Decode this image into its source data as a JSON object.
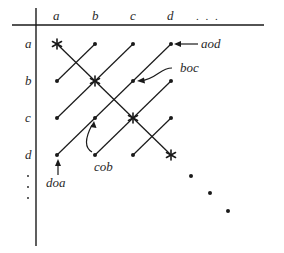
{
  "diagram": {
    "column_headers": [
      "a",
      "b",
      "c",
      "d",
      ". . ."
    ],
    "row_headers": [
      "a",
      "b",
      "c",
      "d"
    ],
    "row_ellipsis": "⋮",
    "annotations": {
      "aod": "aod",
      "boc": "boc",
      "cob": "cob",
      "doa": "doa"
    },
    "colors": {
      "ink": "#1a1a1a",
      "background": "#ffffff"
    },
    "grid": {
      "columns_x": [
        57,
        95,
        133,
        171
      ],
      "rows_y": [
        44,
        81,
        118,
        155
      ]
    },
    "diagonal_markers": [
      "star",
      "star",
      "star",
      "star"
    ],
    "continuation_dots": 3
  }
}
